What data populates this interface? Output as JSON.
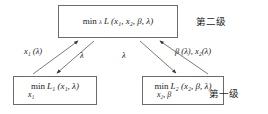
{
  "diagram": {
    "title_text": "",
    "stroke_color": "#6b6b6b",
    "text_color": "#1a1a1a",
    "background": "#ffffff",
    "nodes": {
      "top": {
        "name": "master-problem-box",
        "min_label": "min",
        "min_subscript": "λ",
        "expression": "L (x₁, x₂, β, λ)",
        "under_variable": ""
      },
      "bottom_left": {
        "name": "subproblem-1-box",
        "min_label": "min",
        "min_subscript": "",
        "expression": "L₁ (x₁, λ)",
        "under_variable": "x₁"
      },
      "bottom_right": {
        "name": "subproblem-2-box",
        "min_label": "min",
        "min_subscript": "",
        "expression": "L₂ (x₂, β, λ)",
        "under_variable": "x₂, β"
      }
    },
    "edge_labels": {
      "x1_lambda": "x₁ (λ)",
      "lambda_left": "λ",
      "lambda_right": "λ",
      "beta_x2": "β (λ), x₂(λ)"
    },
    "level_labels": {
      "second": "第二级",
      "first": "第一级"
    }
  }
}
